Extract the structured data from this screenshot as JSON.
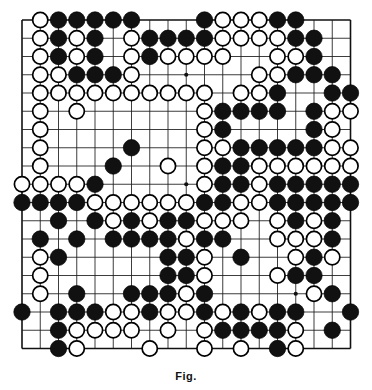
{
  "figure": {
    "kind": "go-board-diagram",
    "caption": "Fig."
  },
  "board": {
    "name": "go-board",
    "size": 19,
    "columns": 19,
    "rows": 19,
    "line_color": "#1a1a1a",
    "border_color": "#111111",
    "background_color": "#ffffff",
    "black_stone_color": "#111111",
    "white_stone_color": "#ffffff",
    "star_points": [
      [
        4,
        4
      ],
      [
        10,
        4
      ],
      [
        16,
        4
      ],
      [
        4,
        10
      ],
      [
        10,
        10
      ],
      [
        16,
        10
      ],
      [
        4,
        16
      ],
      [
        10,
        16
      ],
      [
        16,
        16
      ]
    ],
    "geometry": {
      "left": 22,
      "top": 20,
      "spacing": 18.25,
      "stone_radius": 8.2,
      "star_radius": 2.1
    },
    "legend": {
      "black": "Black stone",
      "white": "White stone",
      "empty": "Empty intersection"
    },
    "stone_counts": {
      "black": 163,
      "white": 141,
      "empty": 57
    },
    "grid": [
      ".WBBBBB...BWWWBB...",
      ".WBWB.WBBBBWWWWBB..",
      ".WBWB.WBWWWW..WWB..",
      ".WWBBBW......WWBBB.",
      ".WWWWWWWWWW.WWB..BB",
      ".W.W......WBBBB.BWW",
      ".W........WB....BW.",
      ".W....B...WWBBBBBWW",
      ".W...B..W.WBBWWWWWW",
      "WWWWB.....WBBWBBBBB",
      "BBBBWWWWWWBBWWBBBBB",
      "..B.BWBWBBWWW.WBWB.",
      ".B.B.BBBBWBB..WWWB.",
      ".WB.....BBW.B..WBW.",
      ".W......BBW...WBB..",
      ".W.B..BBBWB.....WB.",
      "B.BBBWWBWWBWBWBB..B",
      "..BWWWW.W.WBBBBW.B.",
      "..BW...W..W.W.BW..."
    ]
  }
}
